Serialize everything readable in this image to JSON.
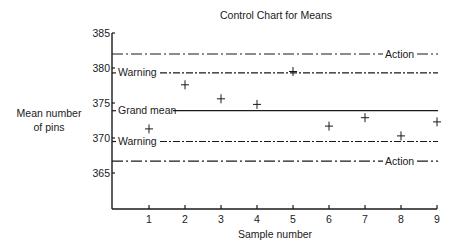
{
  "chart_data": {
    "type": "line",
    "title": "Control Chart for Means",
    "xlabel": "Sample number",
    "ylabel": "Mean number of pins",
    "ylabel_lines": [
      "Mean number",
      "of pins"
    ],
    "x_ticks": [
      1,
      2,
      3,
      4,
      5,
      6,
      7,
      8,
      9
    ],
    "y_ticks": [
      365,
      370,
      375,
      380,
      385
    ],
    "ylim": [
      360,
      385
    ],
    "xlim": [
      0,
      9
    ],
    "grid": false,
    "series": [
      {
        "name": "Sample means",
        "marker": "+",
        "x": [
          1,
          2,
          3,
          4,
          5,
          6,
          7,
          8,
          9
        ],
        "values": [
          371.3,
          377.6,
          375.6,
          374.8,
          379.5,
          371.7,
          372.9,
          370.3,
          372.3
        ]
      }
    ],
    "reference_lines": [
      {
        "name": "Upper action",
        "label": "Action",
        "value": 382.0,
        "style": "dash-dot-long"
      },
      {
        "name": "Upper warning",
        "label": "Warning",
        "value": 379.3,
        "style": "dash-dot"
      },
      {
        "name": "Grand mean",
        "label": "Grand mean",
        "value": 373.9,
        "style": "solid"
      },
      {
        "name": "Lower warning",
        "label": "Warning",
        "value": 369.5,
        "style": "dash-dot"
      },
      {
        "name": "Lower action",
        "label": "Action",
        "value": 366.7,
        "style": "dash-dot-long"
      }
    ]
  }
}
